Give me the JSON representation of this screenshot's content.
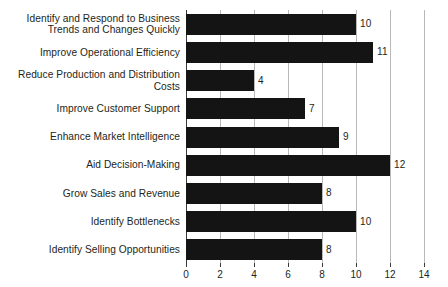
{
  "chart_data": {
    "type": "bar",
    "orientation": "horizontal",
    "title": "",
    "xlabel": "",
    "ylabel": "",
    "xlim": [
      0,
      14
    ],
    "xticks": [
      0,
      2,
      4,
      6,
      8,
      10,
      12,
      14
    ],
    "grid": "vertical",
    "legend": "none",
    "show_value_labels": true,
    "bar_color": "#141414",
    "gridline_color": "#b8b8b8",
    "text_color": "#231f20",
    "background_color": "#ffffff",
    "categories": [
      "Identify and Respond to Business\nTrends and Changes Quickly",
      "Improve Operational Efficiency",
      "Reduce Production and Distribution Costs",
      "Improve Customer Support",
      "Enhance Market Intelligence",
      "Aid Decision-Making",
      "Grow Sales and Revenue",
      "Identify Bottlenecks",
      "Identify Selling Opportunities"
    ],
    "values": [
      10,
      11,
      4,
      7,
      9,
      12,
      8,
      10,
      8
    ],
    "value_labels": [
      "10",
      "11",
      "4",
      "7",
      "9",
      "12",
      "8",
      "10",
      "8"
    ],
    "tick_labels": [
      "0",
      "2",
      "4",
      "6",
      "8",
      "10",
      "12",
      "14"
    ]
  }
}
